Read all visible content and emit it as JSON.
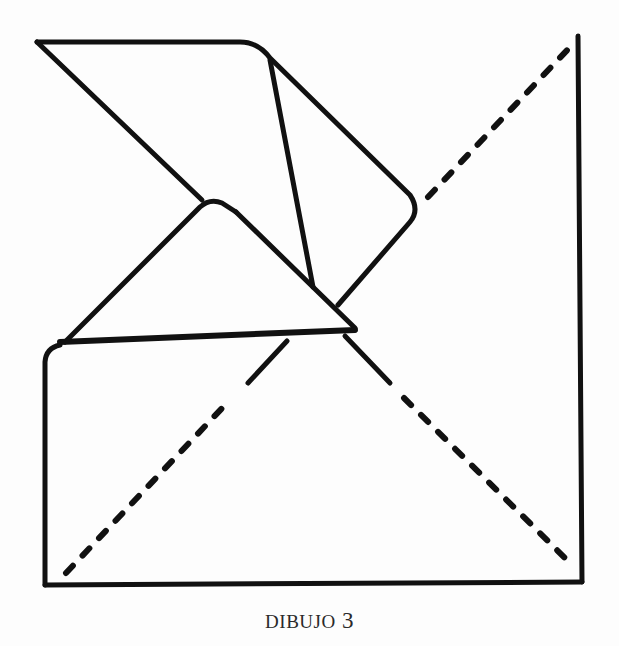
{
  "figure": {
    "caption": "DIBUJO 3",
    "caption_word": "DIBUJO",
    "caption_number": "3",
    "stroke_color": "#111111",
    "background_color": "#fdfdfd"
  },
  "diagram": {
    "square": {
      "top_left": [
        45,
        360
      ],
      "bottom_left": [
        45,
        585
      ],
      "bottom_right": [
        582,
        582
      ],
      "top_right": [
        578,
        36
      ]
    },
    "fold_lines_dashed": [
      {
        "from": [
          65,
          575
        ],
        "to": [
          285,
          345
        ],
        "label": "diagonal-bottom-left"
      },
      {
        "from": [
          430,
          195
        ],
        "to": [
          578,
          40
        ],
        "label": "diagonal-top-right"
      },
      {
        "from": [
          390,
          385
        ],
        "to": [
          575,
          567
        ],
        "label": "diagonal-bottom-right"
      }
    ],
    "flaps": [
      {
        "name": "upper-flap",
        "points": [
          [
            37,
            42
          ],
          [
            245,
            42
          ],
          [
            270,
            60
          ],
          [
            410,
            198
          ],
          [
            338,
            305
          ]
        ]
      },
      {
        "name": "inner-crease",
        "points": [
          [
            270,
            60
          ],
          [
            313,
            287
          ]
        ]
      },
      {
        "name": "lower-triangle-flap",
        "points": [
          [
            65,
            342
          ],
          [
            210,
            202
          ],
          [
            355,
            328
          ]
        ]
      }
    ]
  }
}
